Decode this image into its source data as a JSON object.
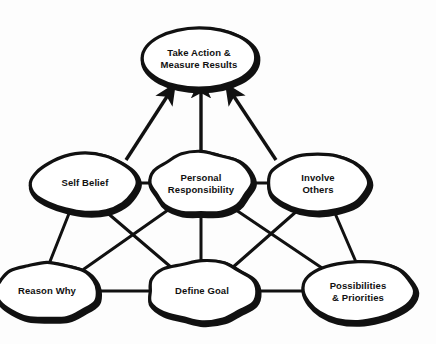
{
  "diagram": {
    "style": {
      "background_color": "#fdfdfd",
      "node_fill_color": "#ffffff",
      "node_stroke_color": "#111111",
      "edge_color": "#111111",
      "text_color": "#111111"
    },
    "nodes": [
      {
        "id": "take-action",
        "label": "Take Action &\nMeasure Results",
        "row": "top",
        "cx": 199,
        "cy": 58,
        "rx": 57,
        "ry": 30
      },
      {
        "id": "self-belief",
        "label": "Self Belief",
        "row": "middle",
        "cx": 85,
        "cy": 183,
        "rx": 53,
        "ry": 29
      },
      {
        "id": "personal-responsibility",
        "label": "Personal\nResponsibility",
        "row": "middle",
        "cx": 201,
        "cy": 183,
        "rx": 50,
        "ry": 31
      },
      {
        "id": "involve-others",
        "label": "Involve\nOthers",
        "row": "middle",
        "cx": 318,
        "cy": 183,
        "rx": 50,
        "ry": 29
      },
      {
        "id": "reason-why",
        "label": "Reason Why",
        "row": "bottom",
        "cx": 47,
        "cy": 291,
        "rx": 51,
        "ry": 28
      },
      {
        "id": "define-goal",
        "label": "Define Goal",
        "row": "bottom",
        "cx": 202,
        "cy": 291,
        "rx": 54,
        "ry": 30
      },
      {
        "id": "possibilities-priorities",
        "label": "Possibilities\n& Priorities",
        "row": "bottom",
        "cx": 358,
        "cy": 291,
        "rx": 55,
        "ry": 30
      }
    ],
    "edges": [
      {
        "id": "edge-self-belief-to-take-action",
        "from": "self-belief",
        "to": "take-action",
        "arrow": true,
        "x1": 126,
        "y1": 160,
        "x2": 168,
        "y2": 95
      },
      {
        "id": "edge-personal-responsibility-to-take-action",
        "from": "personal-responsibility",
        "to": "take-action",
        "arrow": true,
        "x1": 201,
        "y1": 155,
        "x2": 201,
        "y2": 91
      },
      {
        "id": "edge-involve-others-to-take-action",
        "from": "involve-others",
        "to": "take-action",
        "arrow": true,
        "x1": 276,
        "y1": 160,
        "x2": 233,
        "y2": 95
      },
      {
        "id": "edge-self-belief-personal-responsibility",
        "from": "self-belief",
        "to": "personal-responsibility",
        "arrow": false,
        "x1": 137,
        "y1": 183,
        "x2": 151,
        "y2": 183
      },
      {
        "id": "edge-personal-responsibility-involve-others",
        "from": "personal-responsibility",
        "to": "involve-others",
        "arrow": false,
        "x1": 251,
        "y1": 183,
        "x2": 268,
        "y2": 183
      },
      {
        "id": "edge-self-belief-reason-why",
        "from": "self-belief",
        "to": "reason-why",
        "arrow": false,
        "x1": 70,
        "y1": 211,
        "x2": 49,
        "y2": 264
      },
      {
        "id": "edge-self-belief-define-goal",
        "from": "self-belief",
        "to": "define-goal",
        "arrow": false,
        "x1": 104,
        "y1": 210,
        "x2": 172,
        "y2": 268
      },
      {
        "id": "edge-personal-responsibility-reason-why",
        "from": "personal-responsibility",
        "to": "reason-why",
        "arrow": false,
        "x1": 168,
        "y1": 210,
        "x2": 84,
        "y2": 269
      },
      {
        "id": "edge-personal-responsibility-define-goal",
        "from": "personal-responsibility",
        "to": "define-goal",
        "arrow": false,
        "x1": 201,
        "y1": 213,
        "x2": 201,
        "y2": 262
      },
      {
        "id": "edge-personal-responsibility-possibilities",
        "from": "personal-responsibility",
        "to": "possibilities-priorities",
        "arrow": false,
        "x1": 236,
        "y1": 210,
        "x2": 322,
        "y2": 268
      },
      {
        "id": "edge-involve-others-define-goal",
        "from": "involve-others",
        "to": "define-goal",
        "arrow": false,
        "x1": 298,
        "y1": 210,
        "x2": 232,
        "y2": 268
      },
      {
        "id": "edge-involve-others-possibilities",
        "from": "involve-others",
        "to": "possibilities-priorities",
        "arrow": false,
        "x1": 334,
        "y1": 211,
        "x2": 356,
        "y2": 262
      },
      {
        "id": "edge-reason-why-define-goal",
        "from": "reason-why",
        "to": "define-goal",
        "arrow": false,
        "x1": 95,
        "y1": 291,
        "x2": 150,
        "y2": 291
      },
      {
        "id": "edge-define-goal-possibilities",
        "from": "define-goal",
        "to": "possibilities-priorities",
        "arrow": false,
        "x1": 254,
        "y1": 291,
        "x2": 305,
        "y2": 291
      }
    ]
  }
}
